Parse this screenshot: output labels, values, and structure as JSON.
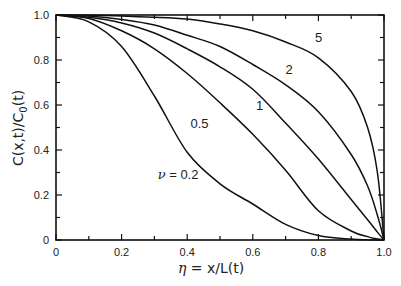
{
  "chart_data": {
    "type": "line",
    "title": "",
    "xlabel": "η = x/L(t)",
    "ylabel": "C(x,t)/C0(t)",
    "xlim": [
      0,
      1.0
    ],
    "ylim": [
      0,
      1.0
    ],
    "grid": false,
    "legend": "inline curve labels",
    "x_ticks": [
      "0",
      "0.2",
      "0.4",
      "0.6",
      "0.8",
      "1.0"
    ],
    "y_ticks": [
      "0",
      "0.2",
      "0.4",
      "0.6",
      "0.8",
      "1.0"
    ],
    "x": [
      0,
      0.1,
      0.2,
      0.3,
      0.4,
      0.5,
      0.6,
      0.7,
      0.8,
      0.9,
      0.95,
      0.98,
      1.0
    ],
    "series": [
      {
        "name": "ν = 0.2",
        "values": [
          1.0,
          0.97,
          0.86,
          0.64,
          0.39,
          0.25,
          0.16,
          0.07,
          0.02,
          0.004,
          0.001,
          0.0,
          0.0
        ]
      },
      {
        "name": "0.5",
        "values": [
          1.0,
          0.985,
          0.93,
          0.85,
          0.74,
          0.61,
          0.47,
          0.31,
          0.13,
          0.04,
          0.015,
          0.004,
          0.0
        ]
      },
      {
        "name": "1",
        "values": [
          1.0,
          0.99,
          0.965,
          0.92,
          0.85,
          0.77,
          0.67,
          0.52,
          0.36,
          0.18,
          0.09,
          0.035,
          0.0
        ]
      },
      {
        "name": "2",
        "values": [
          1.0,
          0.995,
          0.98,
          0.955,
          0.91,
          0.86,
          0.78,
          0.69,
          0.57,
          0.38,
          0.24,
          0.11,
          0.0
        ]
      },
      {
        "name": "5",
        "values": [
          1.0,
          0.999,
          0.995,
          0.99,
          0.982,
          0.96,
          0.93,
          0.88,
          0.81,
          0.66,
          0.5,
          0.3,
          0.0
        ]
      }
    ],
    "annotations": [
      {
        "text": "ν = 0.2",
        "x": 0.31,
        "y": 0.27
      },
      {
        "text": "0.5",
        "x": 0.41,
        "y": 0.5
      },
      {
        "text": "1",
        "x": 0.61,
        "y": 0.58
      },
      {
        "text": "2",
        "x": 0.7,
        "y": 0.74
      },
      {
        "text": "5",
        "x": 0.79,
        "y": 0.88
      }
    ]
  },
  "axes": {
    "x_title_prefix": "η",
    "x_title_rest": " = x/L(t)",
    "y_title": "C(x,t)/C",
    "y_title_sub": "0",
    "y_title_end": "(t)"
  }
}
